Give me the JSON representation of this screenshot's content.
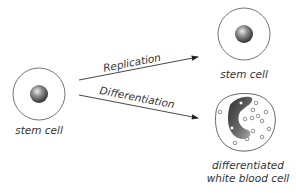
{
  "diagram": {
    "source_cell": {
      "label": "stem cell"
    },
    "paths": [
      {
        "label": "Replication",
        "target_label": "stem cell"
      },
      {
        "label": "Differentiation",
        "target_label_line1": "differentiated",
        "target_label_line2": "white blood cell"
      }
    ],
    "colors": {
      "line": "#333333",
      "cell_outline": "#555555",
      "nucleus": "#6e6e6e",
      "granule": "#666666"
    }
  }
}
